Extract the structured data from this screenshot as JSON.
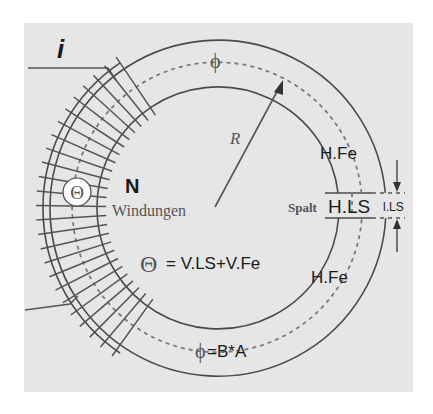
{
  "diagram": {
    "colors": {
      "background": "#e6e6e6",
      "page": "#ffffff",
      "lines": "#4a4a4a",
      "text": "#1a1a1a"
    },
    "labels": {
      "current": "i",
      "flux_top": "ϕ",
      "radius": "R",
      "h_fe_upper": "H.Fe",
      "h_fe_lower": "H.Fe",
      "gap_word": "Spalt",
      "h_ls": "H.LS",
      "l_ls": "l.LS",
      "theta_symbol": "Θ",
      "turns_symbol": "N",
      "turns_word": "Windungen",
      "mmf_equation": "= V.LS+V.Fe",
      "mmf_theta": "Θ",
      "flux_equation": "=B*A",
      "flux_bottom": "ϕ"
    },
    "components": [
      "iron ring core (toroid)",
      "air gap (Spalt) on right side",
      "excitation coil with N turns on left side",
      "mean flux path (dashed)",
      "radius arrow R"
    ]
  }
}
